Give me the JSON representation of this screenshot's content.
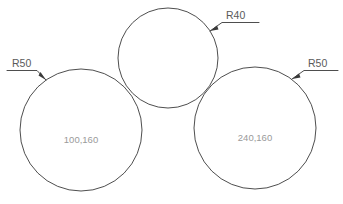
{
  "drawing": {
    "title": "Three tangent circles radius dimension drawing",
    "background_color": "#ffffff",
    "stroke_color": "#3a3a3a",
    "label_color": "#5a5a5a",
    "center_label_color": "#9a9a9a",
    "circles": [
      {
        "id": "left-circle",
        "center_label": "100,160",
        "radius_label": "R50",
        "cx": 81,
        "cy": 130,
        "r": 61,
        "label_x": 81,
        "label_y": 143
      },
      {
        "id": "top-circle",
        "center_label": "",
        "radius_label": "R40",
        "cx": 168,
        "cy": 58,
        "r": 50,
        "label_x": 168,
        "label_y": 58
      },
      {
        "id": "right-circle",
        "center_label": "240,160",
        "radius_label": "R50",
        "cx": 255,
        "cy": 128,
        "r": 61,
        "label_x": 255,
        "label_y": 141
      }
    ],
    "annotations": [
      {
        "id": "left-radius-annotation",
        "text": "R50",
        "text_x": 12,
        "text_y": 67,
        "leader_path": "M 7 70.5 L 37 70.5 L 46 80",
        "arrow_points": "46,80 38.5,75.5 40.5,72"
      },
      {
        "id": "top-radius-annotation",
        "text": "R40",
        "text_x": 226,
        "text_y": 19,
        "leader_path": "M 259 22.5 L 222 22.5 L 210 31",
        "arrow_points": "210,31 218.5,29.5 217,25.5"
      },
      {
        "id": "right-radius-annotation",
        "text": "R50",
        "text_x": 308,
        "text_y": 67,
        "leader_path": "M 338 70.5 L 304 70.5 L 292 79",
        "arrow_points": "292,79 300.5,77.5 299,73.5"
      }
    ]
  }
}
